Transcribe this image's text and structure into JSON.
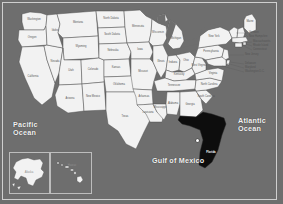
{
  "map": {
    "title": "Map of the United States",
    "background_color": "#6e6e6e",
    "frame_color": "#cfcfcf",
    "land_fill": "#f2f2f2",
    "land_stroke": "#4a4a4a",
    "highlight_fill": "#0d0d0d",
    "highlight_state": "Florida",
    "label_color": "#555555",
    "water_label_color": "#f2f2f2"
  },
  "water_labels": [
    {
      "name": "pacific-ocean",
      "text": "Pacific\nOcean"
    },
    {
      "name": "atlantic-ocean",
      "text": "Atlantic\nOcean"
    },
    {
      "name": "gulf-of-mexico",
      "text": "Gulf of Mexico"
    }
  ],
  "insets": {
    "alaska": {
      "label": "Alaska"
    },
    "hawaii": {
      "label": "Hawaii"
    }
  },
  "marker": {
    "name": "city-marker",
    "state": "Florida"
  },
  "states": [
    {
      "id": "WA",
      "label": "Washington"
    },
    {
      "id": "OR",
      "label": "Oregon"
    },
    {
      "id": "CA",
      "label": "California"
    },
    {
      "id": "NV",
      "label": "Nevada"
    },
    {
      "id": "ID",
      "label": "Idaho"
    },
    {
      "id": "MT",
      "label": "Montana"
    },
    {
      "id": "WY",
      "label": "Wyoming"
    },
    {
      "id": "UT",
      "label": "Utah"
    },
    {
      "id": "AZ",
      "label": "Arizona"
    },
    {
      "id": "CO",
      "label": "Colorado"
    },
    {
      "id": "NM",
      "label": "New Mexico"
    },
    {
      "id": "ND",
      "label": "North Dakota"
    },
    {
      "id": "SD",
      "label": "South Dakota"
    },
    {
      "id": "NE",
      "label": "Nebraska"
    },
    {
      "id": "KS",
      "label": "Kansas"
    },
    {
      "id": "OK",
      "label": "Oklahoma"
    },
    {
      "id": "TX",
      "label": "Texas"
    },
    {
      "id": "MN",
      "label": "Minnesota"
    },
    {
      "id": "IA",
      "label": "Iowa"
    },
    {
      "id": "MO",
      "label": "Missouri"
    },
    {
      "id": "AR",
      "label": "Arkansas"
    },
    {
      "id": "LA",
      "label": "Louisiana"
    },
    {
      "id": "WI",
      "label": "Wisconsin"
    },
    {
      "id": "IL",
      "label": "Illinois"
    },
    {
      "id": "MS",
      "label": "Mississippi"
    },
    {
      "id": "MI",
      "label": "Michigan"
    },
    {
      "id": "IN",
      "label": "Indiana"
    },
    {
      "id": "OH",
      "label": "Ohio"
    },
    {
      "id": "KY",
      "label": "Kentucky"
    },
    {
      "id": "TN",
      "label": "Tennessee"
    },
    {
      "id": "AL",
      "label": "Alabama"
    },
    {
      "id": "GA",
      "label": "Georgia"
    },
    {
      "id": "FL",
      "label": "Florida"
    },
    {
      "id": "SC",
      "label": "South Carolina"
    },
    {
      "id": "NC",
      "label": "North Carolina"
    },
    {
      "id": "VA",
      "label": "Virginia"
    },
    {
      "id": "WV",
      "label": "West Virginia"
    },
    {
      "id": "PA",
      "label": "Pennsylvania"
    },
    {
      "id": "NY",
      "label": "New York"
    },
    {
      "id": "ME",
      "label": "Maine"
    },
    {
      "id": "VT",
      "label": "Vermont"
    },
    {
      "id": "NH",
      "label": "New Hampshire"
    },
    {
      "id": "MA",
      "label": "Massachusetts"
    },
    {
      "id": "RI",
      "label": "Rhode Island"
    },
    {
      "id": "CT",
      "label": "Connecticut"
    },
    {
      "id": "NJ",
      "label": "New Jersey"
    },
    {
      "id": "DE",
      "label": "Delaware"
    },
    {
      "id": "MD",
      "label": "Maryland"
    },
    {
      "id": "DC",
      "label": "Washington D.C."
    }
  ]
}
